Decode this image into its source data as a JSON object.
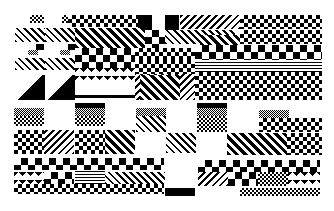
{
  "image": {
    "description": "Abstract black-and-white mosaic of pixel patterns (checkerboards, diagonal hatching, stripes, solid blocks)",
    "width": 334,
    "height": 211,
    "background": "#ffffff",
    "foreground": "#000000"
  },
  "blocks": [
    {
      "x": 30,
      "y": 15,
      "w": 14,
      "h": 8,
      "p": "checker-fine"
    },
    {
      "x": 62,
      "y": 15,
      "w": 35,
      "h": 8,
      "p": "checker-fine"
    },
    {
      "x": 68,
      "y": 15,
      "w": 70,
      "h": 12,
      "p": "checker"
    },
    {
      "x": 138,
      "y": 15,
      "w": 14,
      "h": 16,
      "p": "solid"
    },
    {
      "x": 165,
      "y": 15,
      "w": 14,
      "h": 16,
      "p": "solid"
    },
    {
      "x": 180,
      "y": 15,
      "w": 60,
      "h": 14,
      "p": "diag-r"
    },
    {
      "x": 240,
      "y": 15,
      "w": 82,
      "h": 14,
      "p": "checker"
    },
    {
      "x": 15,
      "y": 28,
      "w": 30,
      "h": 14,
      "p": "diag"
    },
    {
      "x": 45,
      "y": 28,
      "w": 30,
      "h": 14,
      "p": "diag"
    },
    {
      "x": 75,
      "y": 28,
      "w": 70,
      "h": 20,
      "p": "diag-thick"
    },
    {
      "x": 145,
      "y": 30,
      "w": 20,
      "h": 20,
      "p": "checker-big"
    },
    {
      "x": 165,
      "y": 30,
      "w": 70,
      "h": 14,
      "p": "diag"
    },
    {
      "x": 200,
      "y": 35,
      "w": 40,
      "h": 10,
      "p": "diag-thick"
    },
    {
      "x": 240,
      "y": 30,
      "w": 82,
      "h": 14,
      "p": "checker"
    },
    {
      "x": 36,
      "y": 44,
      "w": 8,
      "h": 6,
      "p": "solid"
    },
    {
      "x": 68,
      "y": 44,
      "w": 8,
      "h": 6,
      "p": "solid"
    },
    {
      "x": 75,
      "y": 48,
      "w": 60,
      "h": 20,
      "p": "checker-big"
    },
    {
      "x": 135,
      "y": 48,
      "w": 60,
      "h": 12,
      "p": "checker"
    },
    {
      "x": 195,
      "y": 45,
      "w": 127,
      "h": 15,
      "p": "checker-big"
    },
    {
      "x": 28,
      "y": 50,
      "w": 10,
      "h": 5,
      "p": "gray"
    },
    {
      "x": 60,
      "y": 50,
      "w": 10,
      "h": 5,
      "p": "gray"
    },
    {
      "x": 15,
      "y": 58,
      "w": 30,
      "h": 12,
      "p": "diag"
    },
    {
      "x": 45,
      "y": 58,
      "w": 30,
      "h": 12,
      "p": "diag"
    },
    {
      "x": 135,
      "y": 60,
      "w": 60,
      "h": 14,
      "p": "checker"
    },
    {
      "x": 195,
      "y": 60,
      "w": 127,
      "h": 12,
      "p": "hstripe"
    },
    {
      "x": 75,
      "y": 68,
      "w": 60,
      "h": 12,
      "p": "zig"
    },
    {
      "x": 15,
      "y": 75,
      "w": 30,
      "h": 25,
      "p": "tri"
    },
    {
      "x": 45,
      "y": 75,
      "w": 30,
      "h": 25,
      "p": "tri"
    },
    {
      "x": 135,
      "y": 74,
      "w": 60,
      "h": 26,
      "p": "diag-r"
    },
    {
      "x": 195,
      "y": 72,
      "w": 127,
      "h": 28,
      "p": "checker"
    },
    {
      "x": 140,
      "y": 75,
      "w": 40,
      "h": 25,
      "p": "diag-thick"
    },
    {
      "x": 75,
      "y": 95,
      "w": 60,
      "h": 3,
      "p": "solid"
    },
    {
      "x": 14,
      "y": 108,
      "w": 30,
      "h": 8,
      "p": "gray"
    },
    {
      "x": 14,
      "y": 116,
      "w": 30,
      "h": 10,
      "p": "checker-fine"
    },
    {
      "x": 75,
      "y": 103,
      "w": 30,
      "h": 5,
      "p": "solid"
    },
    {
      "x": 75,
      "y": 108,
      "w": 30,
      "h": 8,
      "p": "gray"
    },
    {
      "x": 75,
      "y": 116,
      "w": 30,
      "h": 10,
      "p": "checker-fine"
    },
    {
      "x": 136,
      "y": 108,
      "w": 30,
      "h": 8,
      "p": "gray"
    },
    {
      "x": 136,
      "y": 116,
      "w": 30,
      "h": 16,
      "p": "diag"
    },
    {
      "x": 197,
      "y": 103,
      "w": 30,
      "h": 5,
      "p": "solid"
    },
    {
      "x": 197,
      "y": 108,
      "w": 30,
      "h": 8,
      "p": "gray"
    },
    {
      "x": 197,
      "y": 116,
      "w": 30,
      "h": 16,
      "p": "checker-fine"
    },
    {
      "x": 259,
      "y": 110,
      "w": 30,
      "h": 8,
      "p": "gray"
    },
    {
      "x": 259,
      "y": 118,
      "w": 63,
      "h": 14,
      "p": "checker"
    },
    {
      "x": 14,
      "y": 130,
      "w": 30,
      "h": 24,
      "p": "checker"
    },
    {
      "x": 44,
      "y": 130,
      "w": 30,
      "h": 24,
      "p": "diag-r"
    },
    {
      "x": 75,
      "y": 130,
      "w": 30,
      "h": 24,
      "p": "checker"
    },
    {
      "x": 105,
      "y": 130,
      "w": 30,
      "h": 24,
      "p": "diag-thick"
    },
    {
      "x": 166,
      "y": 133,
      "w": 30,
      "h": 20,
      "p": "diag"
    },
    {
      "x": 227,
      "y": 133,
      "w": 60,
      "h": 22,
      "p": "diag-thick"
    },
    {
      "x": 287,
      "y": 133,
      "w": 35,
      "h": 22,
      "p": "checker"
    },
    {
      "x": 14,
      "y": 158,
      "w": 150,
      "h": 12,
      "p": "checker-big"
    },
    {
      "x": 198,
      "y": 160,
      "w": 122,
      "h": 12,
      "p": "checker-big"
    },
    {
      "x": 14,
      "y": 172,
      "w": 30,
      "h": 12,
      "p": "zig"
    },
    {
      "x": 44,
      "y": 172,
      "w": 30,
      "h": 12,
      "p": "checker-big"
    },
    {
      "x": 75,
      "y": 170,
      "w": 30,
      "h": 14,
      "p": "hstripe"
    },
    {
      "x": 105,
      "y": 172,
      "w": 60,
      "h": 12,
      "p": "diag"
    },
    {
      "x": 198,
      "y": 172,
      "w": 30,
      "h": 14,
      "p": "diag-r"
    },
    {
      "x": 228,
      "y": 172,
      "w": 30,
      "h": 14,
      "p": "checker-big"
    },
    {
      "x": 258,
      "y": 172,
      "w": 30,
      "h": 14,
      "p": "checker-fine"
    },
    {
      "x": 288,
      "y": 172,
      "w": 32,
      "h": 14,
      "p": "zig"
    },
    {
      "x": 14,
      "y": 184,
      "w": 150,
      "h": 10,
      "p": "checker"
    },
    {
      "x": 165,
      "y": 188,
      "w": 30,
      "h": 8,
      "p": "solid"
    },
    {
      "x": 240,
      "y": 188,
      "w": 80,
      "h": 8,
      "p": "checker-fine"
    }
  ]
}
